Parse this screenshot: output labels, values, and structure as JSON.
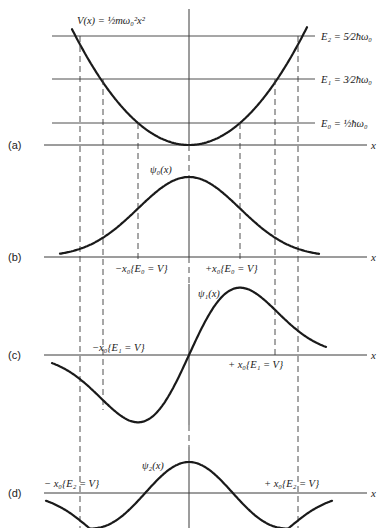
{
  "figure": {
    "center_x": 189,
    "panels": [
      {
        "id": "a",
        "label": "(a)",
        "baseline_y": 145
      },
      {
        "id": "b",
        "label": "(b)",
        "baseline_y": 257
      },
      {
        "id": "c",
        "label": "(c)",
        "baseline_y": 355
      },
      {
        "id": "d",
        "label": "(d)",
        "baseline_y": 493
      }
    ],
    "axis_label": "x",
    "potential": {
      "label": "V(x) = ½mω₀²x²",
      "k": 0.00846
    },
    "energy_levels": [
      {
        "name": "E0",
        "label": "E₀ = ½ħω₀",
        "y": 123,
        "turning_half_width": 51
      },
      {
        "name": "E1",
        "label": "E₁ = 3⁄2ħω₀",
        "y": 79,
        "turning_half_width": 86
      },
      {
        "name": "E2",
        "label": "E₂ = 5⁄2ħω₀",
        "y": 36,
        "turning_half_width": 109
      }
    ],
    "wavefunctions": [
      {
        "name": "psi0",
        "label": "ψ₀(x)"
      },
      {
        "name": "psi1",
        "label": "ψ₁(x)"
      },
      {
        "name": "psi2",
        "label": "ψ₂(x)"
      }
    ],
    "turning_point_labels": {
      "e0_minus": "−x₀{E₀ = V}",
      "e0_plus": "+x₀{E₀ = V}",
      "e1_minus": "−x₀{E₁ = V}",
      "e1_plus": "+ x₀{E₁ = V}",
      "e2_minus": "− x₀{E₂ = V}",
      "e2_plus": "+ x₀{E₂ = V}"
    }
  }
}
